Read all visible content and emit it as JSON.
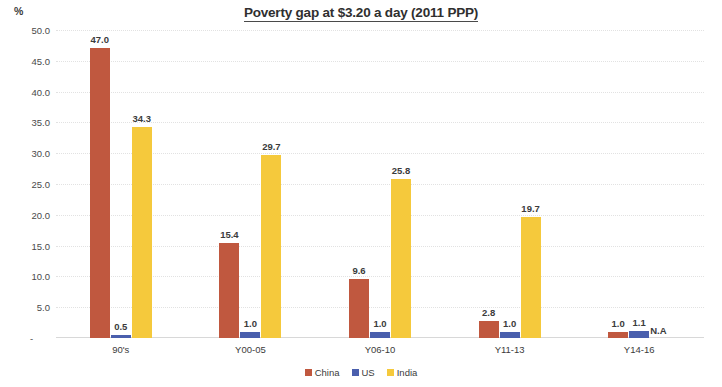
{
  "chart_data": {
    "type": "bar",
    "title": "Poverty gap at $3.20 a day (2011 PPP)",
    "xlabel": "",
    "ylabel": "%",
    "ylim": [
      0,
      50
    ],
    "ytick_labels": [
      "50.0",
      "45.0",
      "40.0",
      "35.0",
      "30.0",
      "25.0",
      "20.0",
      "15.0",
      "10.0",
      "5.0",
      "-"
    ],
    "ytick_values": [
      50,
      45,
      40,
      35,
      30,
      25,
      20,
      15,
      10,
      5,
      0
    ],
    "grid": true,
    "legend_position": "bottom",
    "categories": [
      "90's",
      "Y00-05",
      "Y06-10",
      "Y11-13",
      "Y14-16"
    ],
    "series": [
      {
        "name": "China",
        "color": "#C0583F",
        "values": [
          47.0,
          15.4,
          9.6,
          2.8,
          1.0
        ],
        "labels": [
          "47.0",
          "15.4",
          "9.6",
          "2.8",
          "1.0"
        ]
      },
      {
        "name": "US",
        "color": "#4A5FAD",
        "values": [
          0.5,
          1.0,
          1.0,
          1.0,
          1.1
        ],
        "labels": [
          "0.5",
          "1.0",
          "1.0",
          "1.0",
          "1.1"
        ]
      },
      {
        "name": "India",
        "color": "#F5C93C",
        "values": [
          34.3,
          29.7,
          25.8,
          19.7,
          null
        ],
        "labels": [
          "34.3",
          "29.7",
          "25.8",
          "19.7",
          "N.A"
        ]
      }
    ],
    "annotations": [
      {
        "text": "N.A",
        "series": "India",
        "category": "Y14-16"
      }
    ]
  },
  "legend": {
    "items": [
      {
        "label": "China",
        "color": "#C0583F"
      },
      {
        "label": "US",
        "color": "#4A5FAD"
      },
      {
        "label": "India",
        "color": "#F5C93C"
      }
    ]
  },
  "axis": {
    "unit": "%",
    "zero_dash": "-"
  }
}
